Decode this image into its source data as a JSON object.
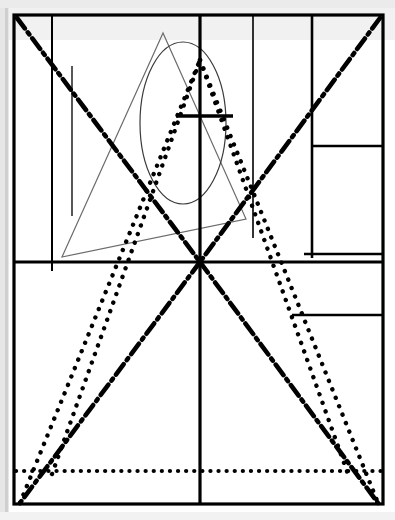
{
  "canvas": {
    "width": 395,
    "height": 520,
    "background": "#ffffff",
    "title": "Abstract Geometric Line Composition"
  },
  "palette": {
    "ink": "#000000",
    "thin_ink": "#555555",
    "paper": "#ffffff",
    "scan_edge": "#d8d8d8",
    "scan_shadow": "#c4c4c4"
  },
  "frame": {
    "name": "outer-rectangle",
    "x": 14,
    "y": 15,
    "width": 369,
    "height": 489,
    "stroke": "#000000",
    "stroke_width": 3.2,
    "fill": "none"
  },
  "scan_artifacts": [
    {
      "name": "left-scan-band",
      "x": 0,
      "y": 0,
      "width": 9,
      "height": 520,
      "fill": "#e6e6e6"
    },
    {
      "name": "left-scan-shadow",
      "x": 5,
      "y": 0,
      "width": 3,
      "height": 520,
      "fill": "#cfcfcf"
    },
    {
      "name": "top-scan-band",
      "x": 0,
      "y": 0,
      "width": 395,
      "height": 8,
      "fill": "#ebebeb"
    },
    {
      "name": "top-gray-wash",
      "x": 9,
      "y": 8,
      "width": 386,
      "height": 32,
      "fill": "#f1f1f1"
    },
    {
      "name": "bottom-scan-band",
      "x": 0,
      "y": 512,
      "width": 395,
      "height": 8,
      "fill": "#f2f2f2"
    }
  ],
  "structure_lines": [
    {
      "name": "main-vertical-axis",
      "x1": 200,
      "y1": 15,
      "x2": 200,
      "y2": 504,
      "stroke_width": 3.2,
      "stroke": "#000000",
      "style": "solid"
    },
    {
      "name": "main-horizontal-divider",
      "x1": 14,
      "y1": 262,
      "x2": 383,
      "y2": 262,
      "stroke_width": 3.2,
      "stroke": "#000000",
      "style": "solid"
    },
    {
      "name": "left-inner-vertical",
      "x1": 52,
      "y1": 15,
      "x2": 52,
      "y2": 271,
      "stroke_width": 2.0,
      "stroke": "#000000",
      "style": "solid"
    },
    {
      "name": "left-thin-vertical",
      "x1": 72,
      "y1": 66,
      "x2": 72,
      "y2": 216,
      "stroke_width": 1.4,
      "stroke": "#111111",
      "style": "solid"
    },
    {
      "name": "center-right-thin-vertical",
      "x1": 253,
      "y1": 15,
      "x2": 253,
      "y2": 238,
      "stroke_width": 1.6,
      "stroke": "#000000",
      "style": "solid"
    },
    {
      "name": "right-panel-vertical",
      "x1": 312,
      "y1": 15,
      "x2": 312,
      "y2": 258,
      "stroke_width": 2.6,
      "stroke": "#000000",
      "style": "solid"
    },
    {
      "name": "right-panel-upper-horizontal",
      "x1": 312,
      "y1": 146,
      "x2": 383,
      "y2": 146,
      "stroke_width": 2.6,
      "stroke": "#000000",
      "style": "solid"
    },
    {
      "name": "right-panel-lower-horizontal",
      "x1": 304,
      "y1": 254,
      "x2": 383,
      "y2": 254,
      "stroke_width": 2.6,
      "stroke": "#000000",
      "style": "solid"
    },
    {
      "name": "right-short-horizontal",
      "x1": 292,
      "y1": 315,
      "x2": 383,
      "y2": 315,
      "stroke_width": 2.6,
      "stroke": "#000000",
      "style": "solid"
    },
    {
      "name": "cross-horizontal-bar",
      "x1": 176,
      "y1": 116,
      "x2": 233,
      "y2": 116,
      "stroke_width": 3.4,
      "stroke": "#000000",
      "style": "solid"
    }
  ],
  "dotted_lines": [
    {
      "name": "dotted-diagonal-up-right",
      "x1": 52,
      "y1": 474,
      "x2": 200,
      "y2": 60,
      "stroke_width": 4.4,
      "dash": "0.1 9",
      "stroke": "#000000"
    },
    {
      "name": "dotted-diagonal-down-right",
      "x1": 200,
      "y1": 60,
      "x2": 348,
      "y2": 474,
      "stroke_width": 4.4,
      "dash": "0.1 9",
      "stroke": "#000000"
    },
    {
      "name": "dotted-v-left-leg",
      "x1": 20,
      "y1": 503,
      "x2": 200,
      "y2": 60,
      "stroke_width": 4.4,
      "dash": "0.1 9",
      "stroke": "#000000"
    },
    {
      "name": "dotted-v-right-leg",
      "x1": 200,
      "y1": 60,
      "x2": 378,
      "y2": 503,
      "stroke_width": 4.4,
      "dash": "0.1 9",
      "stroke": "#000000"
    },
    {
      "name": "dotted-baseline-horizontal",
      "x1": 16,
      "y1": 471,
      "x2": 381,
      "y2": 471,
      "stroke_width": 4.2,
      "dash": "0.1 8",
      "stroke": "#000000"
    }
  ],
  "dash_dot_lines": [
    {
      "name": "dashdot-diagonal-top-left-to-center",
      "x1": 17,
      "y1": 18,
      "x2": 200,
      "y2": 262,
      "stroke_width": 4.6,
      "dash": "13 5 2.5 5",
      "stroke": "#000000"
    },
    {
      "name": "dashdot-diagonal-center-to-bottom-left",
      "x1": 200,
      "y1": 262,
      "x2": 20,
      "y2": 503,
      "stroke_width": 4.6,
      "dash": "13 5 2.5 5",
      "stroke": "#000000"
    },
    {
      "name": "dashdot-diagonal-top-right-to-center",
      "x1": 380,
      "y1": 18,
      "x2": 200,
      "y2": 262,
      "stroke_width": 4.6,
      "dash": "13 5 2.5 5",
      "stroke": "#000000"
    },
    {
      "name": "dashdot-diagonal-center-to-bottom-right",
      "x1": 200,
      "y1": 262,
      "x2": 378,
      "y2": 503,
      "stroke_width": 4.6,
      "dash": "13 5 2.5 5",
      "stroke": "#000000"
    }
  ],
  "ellipse": {
    "name": "center-ellipse",
    "cx": 183,
    "cy": 123,
    "rx": 43,
    "ry": 81,
    "stroke": "#3a3a3a",
    "stroke_width": 1.2,
    "fill": "none"
  },
  "triangle": {
    "name": "thin-triangle",
    "points": "163,33 62,257 246,219",
    "stroke": "#6b6b6b",
    "stroke_width": 1.2,
    "fill": "none"
  },
  "legend": {
    "shapes_count": 26,
    "line_styles": [
      "solid",
      "dotted",
      "dash-dot"
    ],
    "description": "Technical drawing of overlapping solid, dotted and dash-dot construction lines with an ellipse and a thin triangle inside a bordered rectangle."
  }
}
